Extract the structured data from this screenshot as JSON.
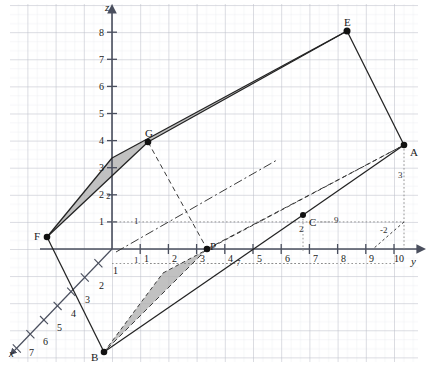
{
  "figure": {
    "type": "3d-coordinate-diagram",
    "background": "#ffffff",
    "grid_color": "#b9bcc6",
    "grid_minor_color": "#dddfe6",
    "axis_color": "#4a4f5e",
    "shade_fill": "#b3b3b3",
    "stroke_color": "#2b2b2b",
    "width": 426,
    "height": 369
  },
  "geometry": {
    "origin": {
      "x": 112,
      "y": 249
    },
    "unit_y_px": 28.2,
    "unit_z_px": 27.1,
    "unit_x": {
      "dx": -13.6,
      "dy": 14.2
    }
  },
  "axes": [
    {
      "name": "x",
      "label": "x",
      "label_pos": {
        "x": 8,
        "y": 352
      },
      "ticks": [
        "1",
        "2",
        "3",
        "4",
        "5",
        "6",
        "7"
      ]
    },
    {
      "name": "y",
      "label": "y",
      "label_pos": {
        "x": 412,
        "y": 261
      },
      "ticks": [
        "1",
        "2",
        "3",
        "4",
        "5",
        "6",
        "7",
        "8",
        "9",
        "10"
      ]
    },
    {
      "name": "z",
      "label": "z",
      "label_pos": {
        "x": 103,
        "y": 4
      },
      "ticks": [
        "1",
        "2",
        "3",
        "4",
        "5",
        "6",
        "7",
        "8"
      ]
    }
  ],
  "points": [
    {
      "id": "A",
      "label": "A",
      "px": 404,
      "py": 145,
      "label_dx": 6,
      "label_dy": 4
    },
    {
      "id": "B",
      "label": "B",
      "px": 104,
      "py": 352,
      "label_dx": -13,
      "label_dy": 4
    },
    {
      "id": "C",
      "label": "C",
      "px": 303,
      "py": 215,
      "label_dx": 6,
      "label_dy": 5
    },
    {
      "id": "E",
      "label": "E",
      "px": 347,
      "py": 31,
      "label_dx": -3,
      "label_dy": -12
    },
    {
      "id": "F",
      "label": "F",
      "px": 47,
      "py": 237,
      "label_dx": -13,
      "label_dy": -2
    },
    {
      "id": "G",
      "label": "G",
      "px": 148,
      "py": 142,
      "label_dx": -3,
      "label_dy": -12
    },
    {
      "id": "P",
      "label": "P",
      "px": 207,
      "py": 249,
      "label_dx": 3,
      "label_dy": -6
    }
  ],
  "annotations": [
    {
      "text": "3",
      "x": 399,
      "y": 174,
      "kind": "dashed-measure"
    },
    {
      "text": "-2",
      "x": 383,
      "y": 229,
      "kind": "dashed-measure"
    },
    {
      "text": "9",
      "x": 336,
      "y": 219,
      "kind": "dotted-guide"
    },
    {
      "text": "2",
      "x": 300,
      "y": 228,
      "kind": "dotted-guide"
    },
    {
      "text": "7",
      "x": 238,
      "y": 265,
      "kind": "dotted-guide"
    },
    {
      "text": "1",
      "x": 136,
      "y": 222,
      "kind": "dotted-guide"
    },
    {
      "text": "1",
      "x": 136,
      "y": 261,
      "kind": "dotted-guide"
    },
    {
      "text": "2",
      "x": 108,
      "y": 196,
      "kind": "dotted-guide"
    },
    {
      "text": "1",
      "x": 115,
      "y": 272,
      "kind": "x-axis-tick"
    },
    {
      "text": "2",
      "x": 101,
      "y": 287,
      "kind": "x-axis-tick"
    },
    {
      "text": "3",
      "x": 87,
      "y": 301,
      "kind": "x-axis-tick"
    },
    {
      "text": "4",
      "x": 73,
      "y": 315,
      "kind": "x-axis-tick"
    },
    {
      "text": "5",
      "x": 59,
      "y": 329,
      "kind": "x-axis-tick"
    },
    {
      "text": "6",
      "x": 45,
      "y": 343,
      "kind": "x-axis-tick"
    },
    {
      "text": "7",
      "x": 31,
      "y": 352,
      "kind": "x-axis-tick"
    }
  ],
  "shaded_polygons": [
    {
      "name": "upper-band",
      "points": "47,237 148,142 347,31 112,158"
    },
    {
      "name": "lower-band",
      "points": "104,352 207,249 404,145 163,273"
    }
  ],
  "solid_edges": [
    {
      "name": "edge-F-G",
      "from": "47,237",
      "to": "148,142"
    },
    {
      "name": "edge-G-E",
      "from": "148,142",
      "to": "347,31"
    },
    {
      "name": "edge-E-A",
      "from": "347,31",
      "to": "404,145"
    },
    {
      "name": "edge-A-C",
      "from": "404,145",
      "to": "303,215"
    },
    {
      "name": "edge-C-B",
      "from": "303,215",
      "to": "104,352"
    },
    {
      "name": "edge-B-F",
      "from": "104,352",
      "to": "47,237"
    },
    {
      "name": "edge-F-origin",
      "from": "47,237",
      "to": "112,158"
    }
  ],
  "dashed_lines": [
    {
      "name": "dash-G-P",
      "from": "148,142",
      "to": "207,249"
    },
    {
      "name": "dash-P-A",
      "from": "207,249",
      "to": "404,145"
    },
    {
      "name": "dash-P-upleft",
      "from": "207,249",
      "to": "112,249"
    },
    {
      "name": "dashdot-diagonal",
      "from": "116,251",
      "to": "277,160"
    },
    {
      "name": "dash-A-vertical",
      "from": "404,145",
      "to": "404,249"
    },
    {
      "name": "dash-10-to-9",
      "from": "404,219",
      "to": "375,249"
    }
  ]
}
